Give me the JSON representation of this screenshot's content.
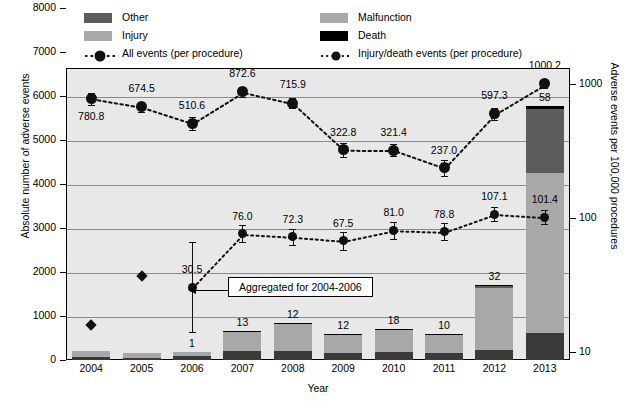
{
  "chart_data": {
    "type": "bar",
    "title": "",
    "xlabel": "Year",
    "ylabel": "Absolute number of adverse events",
    "ylabel_right": "Adverse events per 100,000 procedures",
    "categories": [
      "2004",
      "2005",
      "2006",
      "2007",
      "2008",
      "2009",
      "2010",
      "2011",
      "2012",
      "2013"
    ],
    "ylim": [
      0,
      8000
    ],
    "yticks": [
      0,
      1000,
      2000,
      3000,
      4000,
      5000,
      6000,
      7000,
      8000
    ],
    "ylim_right": [
      10,
      1000
    ],
    "yticks_right": [
      10,
      100,
      1000
    ],
    "right_axis_scale": "log",
    "grid": true,
    "legend_position": "top-inside",
    "stacked_series": [
      {
        "name": "Injury",
        "color": "#3a3a3a",
        "values": [
          60,
          45,
          80,
          195,
          210,
          160,
          180,
          150,
          235,
          620
        ]
      },
      {
        "name": "Malfunction",
        "color": "#a8a8a8",
        "values": [
          140,
          110,
          105,
          460,
          620,
          410,
          500,
          425,
          1400,
          3620
        ]
      },
      {
        "name": "Other",
        "color": "#5c5c5c",
        "values": [
          0,
          0,
          0,
          0,
          0,
          0,
          0,
          0,
          45,
          1470
        ]
      },
      {
        "name": "Death",
        "color": "#000000",
        "values": [
          1,
          1,
          1,
          13,
          12,
          12,
          18,
          10,
          32,
          58
        ]
      }
    ],
    "bar_labels": [
      "",
      "",
      "1",
      "13",
      "12",
      "12",
      "18",
      "10",
      "32",
      "58"
    ],
    "line_series": [
      {
        "name": "All events (per procedure)",
        "marker": "filled-circle",
        "line_style": "dotted",
        "values": [
          780.8,
          674.5,
          510.6,
          872.6,
          715.9,
          322.8,
          321.4,
          237.0,
          597.3,
          1000.2
        ],
        "labels": [
          "780.8",
          "674.5",
          "510.6",
          "872.6",
          "715.9",
          "322.8",
          "321.4",
          "237.0",
          "597.3",
          "1000.2"
        ],
        "error_bars": true
      },
      {
        "name": "Injury/death events (per procedure)",
        "marker": "filled-circle",
        "line_style": "dotted",
        "values": [
          null,
          null,
          30.5,
          76.0,
          72.3,
          67.5,
          81.0,
          78.8,
          107.1,
          101.4
        ],
        "labels": [
          "",
          "",
          "30.5",
          "76.0",
          "72.3",
          "67.5",
          "81.0",
          "78.8",
          "107.1",
          "101.4"
        ],
        "error_bars": true,
        "diamond_points": [
          {
            "year": "2004",
            "value": 16.0
          },
          {
            "year": "2005",
            "value": 37.0
          }
        ]
      }
    ],
    "annotation": {
      "text": "Aggregated for 2004-2006",
      "points_to": "2006"
    }
  },
  "legend": {
    "items": [
      {
        "label": "Other",
        "swatch": "#5c5c5c",
        "kind": "swatch"
      },
      {
        "label": "Injury",
        "swatch": "#a8a8a8",
        "kind": "swatch"
      },
      {
        "label": "All events (per procedure)",
        "swatch": "#111111",
        "kind": "marker-dashed"
      },
      {
        "label": "Malfunction",
        "swatch": "#a8a8a8",
        "kind": "swatch"
      },
      {
        "label": "Death",
        "swatch": "#000000",
        "kind": "swatch"
      },
      {
        "label": "Injury/death events (per procedure)",
        "swatch": "#111111",
        "kind": "marker-dotted"
      }
    ]
  },
  "axes": {
    "left_ticks": [
      "8000",
      "7000",
      "6000",
      "5000",
      "4000",
      "3000",
      "2000",
      "1000",
      "0"
    ],
    "right_ticks": [
      "1000",
      "100",
      "10"
    ],
    "x_ticks": [
      "2004",
      "2005",
      "2006",
      "2007",
      "2008",
      "2009",
      "2010",
      "2011",
      "2012",
      "2013"
    ],
    "left_title": "Absolute number of adverse events",
    "right_title": "Adverse events per 100,000 procedures",
    "x_title": "Year"
  },
  "annotation": {
    "text": "Aggregated for 2004-2006"
  }
}
